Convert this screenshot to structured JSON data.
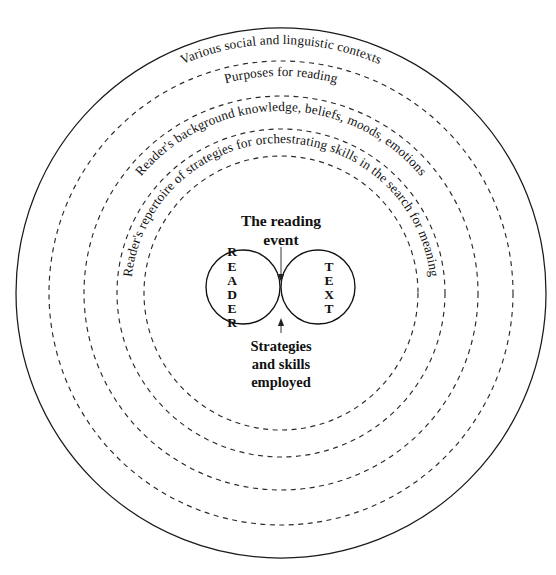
{
  "diagram": {
    "type": "concentric-rings-venn",
    "canvas": {
      "width": 556,
      "height": 575
    },
    "center": {
      "x": 281,
      "y": 293
    },
    "colors": {
      "ink": "#111111",
      "ring_solid": "#1a1a1a",
      "ring_dashed": "#2a2a2a",
      "lens_dotted": "#7a7a7a",
      "arrow": "#4a4a4a",
      "background": "#ffffff"
    },
    "rings": [
      {
        "index": 0,
        "radius": 265,
        "style": "solid",
        "label": "Various social and linguistic contexts",
        "label_radius": 249,
        "label_arc_center_deg": 270,
        "label_font_size": 13.4
      },
      {
        "index": 1,
        "radius": 232,
        "style": "dashed",
        "label": "Purposes for reading",
        "label_radius": 217,
        "label_arc_center_deg": 270,
        "label_font_size": 13.4
      },
      {
        "index": 2,
        "radius": 197,
        "style": "dashed",
        "label": "Reader's background knowledge, beliefs, moods, emotions",
        "label_radius": 182,
        "label_arc_center_deg": 270,
        "label_font_size": 13.0
      },
      {
        "index": 3,
        "radius": 164,
        "style": "dashed",
        "label": "Reader's repertoire of strategies for orchestrating skills in the search for meaning",
        "label_radius": 150,
        "label_arc_center_deg": 270,
        "label_font_size": 12.6
      },
      {
        "index": 4,
        "radius": 137,
        "style": "dashed",
        "label": "",
        "label_radius": 0,
        "label_arc_center_deg": 270,
        "label_font_size": 0
      }
    ],
    "center_group": {
      "title_lines": [
        "The reading",
        "event"
      ],
      "caption_lines": [
        "Strategies",
        "and skills",
        "employed"
      ],
      "venn": {
        "left_circle": {
          "cx": 243,
          "cy": 287,
          "r": 37
        },
        "right_circle": {
          "cx": 318,
          "cy": 287,
          "r": 37
        },
        "left_label": "READER",
        "right_label": "TEXT",
        "left_letters": [
          "R",
          "E",
          "A",
          "D",
          "E",
          "R"
        ],
        "right_letters": [
          "T",
          "E",
          "X",
          "T"
        ],
        "intersection_label": "overlap / strategies and skills"
      },
      "arrows": [
        {
          "name": "top-arrow",
          "from": {
            "x": 281,
            "y": 247
          },
          "to": {
            "x": 281,
            "y": 282
          },
          "direction": "down"
        },
        {
          "name": "bottom-arrow",
          "from": {
            "x": 281,
            "y": 333
          },
          "to": {
            "x": 281,
            "y": 318
          },
          "direction": "up"
        }
      ]
    }
  }
}
